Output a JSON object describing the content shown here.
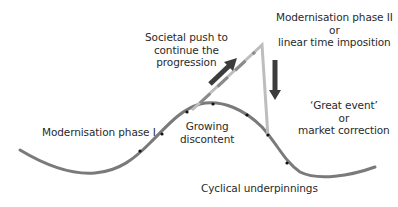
{
  "diagram": {
    "labels": {
      "modernisation_phase_1": "Modernisation phase I",
      "societal_push": [
        "Societal push to",
        "continue the",
        "progression"
      ],
      "modernisation_phase_2": [
        "Modernisation phase II",
        "or",
        "linear time imposition"
      ],
      "growing_discontent": [
        "Growing",
        "discontent"
      ],
      "great_event": [
        "‘Great event’",
        "or",
        "market correction"
      ],
      "cyclical_underpinnings": "Cyclical underpinnings"
    },
    "colors": {
      "cyclical_curve": "#7a7a7a",
      "linear_line": "#bdbdbd",
      "arrow": "#3c3c3c",
      "text": "#2a2a2a",
      "direction_marker": "#111111"
    },
    "elements": {
      "cyclical_curve": "wave curve with direction markers",
      "linear_path": "straight line rising to apex then dropping vertically",
      "up_arrow": "arrow-up-right-icon",
      "down_arrow": "arrow-down-icon"
    }
  }
}
